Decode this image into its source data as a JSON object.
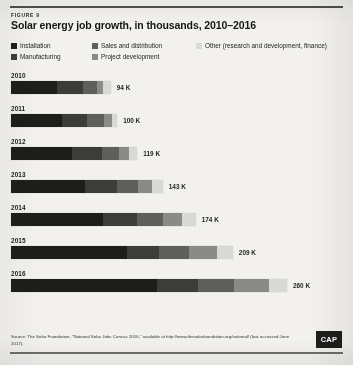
{
  "figure": {
    "label": "FIGURE 9",
    "title": "Solar energy job growth, in thousands, 2010–2016"
  },
  "legend": {
    "items": [
      {
        "label": "Installation",
        "color": "#1d1d1b"
      },
      {
        "label": "Manufacturing",
        "color": "#3c3c3a"
      },
      {
        "label": "Sales and distribution",
        "color": "#5e5e5c"
      },
      {
        "label": "Project development",
        "color": "#8a8a88"
      },
      {
        "label": "Other (research and development, finance)",
        "color": "#d8d8d4"
      }
    ]
  },
  "source": {
    "text": "Source: The Solar Foundation, \"National Solar Jobs Census 2016,\" available at http://www.thesolarfoundation.org/national/ (last accessed June 2017).",
    "logo": "CAP"
  },
  "chart_data": {
    "type": "bar",
    "orientation": "horizontal",
    "stacked": true,
    "title": "Solar energy job growth, in thousands, 2010–2016",
    "xlabel": "",
    "ylabel": "",
    "unit": "thousands of jobs",
    "categories": [
      "2010",
      "2011",
      "2012",
      "2013",
      "2014",
      "2015",
      "2016"
    ],
    "totals": [
      94,
      100,
      119,
      143,
      174,
      209,
      260
    ],
    "value_labels": [
      "94 K",
      "100 K",
      "119 K",
      "143 K",
      "174 K",
      "209 K",
      "260 K"
    ],
    "series": [
      {
        "name": "Installation",
        "color": "#1d1d1b",
        "values": [
          43,
          48,
          57,
          70,
          87,
          109,
          138
        ]
      },
      {
        "name": "Manufacturing",
        "color": "#3c3c3a",
        "values": [
          25,
          24,
          29,
          30,
          32,
          30,
          38
        ]
      },
      {
        "name": "Sales and distribution",
        "color": "#5e5e5c",
        "values": [
          13,
          16,
          16,
          20,
          24,
          29,
          34
        ]
      },
      {
        "name": "Project development",
        "color": "#8a8a88",
        "values": [
          6,
          7,
          9,
          13,
          18,
          26,
          33
        ]
      },
      {
        "name": "Other (research and development, finance)",
        "color": "#d8d8d4",
        "values": [
          7,
          5,
          8,
          10,
          13,
          15,
          17
        ]
      }
    ],
    "xlim": [
      0,
      260
    ],
    "grid": false,
    "legend_position": "top"
  }
}
